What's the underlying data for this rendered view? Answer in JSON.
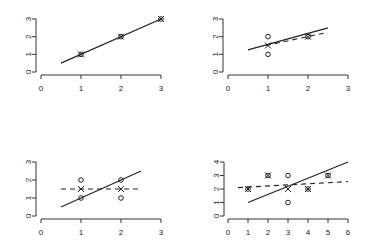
{
  "chart_data": [
    {
      "type": "scatter",
      "panel": "top-left",
      "title": "",
      "xlabel": "",
      "ylabel": "",
      "xlim": [
        0,
        3
      ],
      "ylim": [
        0,
        3
      ],
      "xticks": [
        0,
        1,
        2,
        3
      ],
      "yticks": [
        0,
        1,
        2,
        3
      ],
      "grid": false,
      "points_circle": [
        [
          1,
          1
        ],
        [
          2,
          2
        ],
        [
          3,
          3
        ]
      ],
      "points_cross": [
        [
          1,
          1
        ],
        [
          2,
          2
        ],
        [
          3,
          3
        ]
      ],
      "solid_line": [
        [
          0.5,
          0.5
        ],
        [
          3,
          3
        ]
      ],
      "dashed_line": null
    },
    {
      "type": "scatter",
      "panel": "top-right",
      "title": "",
      "xlabel": "",
      "ylabel": "",
      "xlim": [
        0,
        3
      ],
      "ylim": [
        0,
        3
      ],
      "xticks": [
        0,
        1,
        2,
        3
      ],
      "yticks": [
        0,
        1,
        2,
        3
      ],
      "grid": false,
      "points_circle": [
        [
          1,
          1
        ],
        [
          1,
          2
        ],
        [
          2,
          2
        ]
      ],
      "points_cross": [
        [
          1,
          1.5
        ],
        [
          2,
          2
        ]
      ],
      "solid_line": [
        [
          0.5,
          1.25
        ],
        [
          2.5,
          2.5
        ]
      ],
      "dashed_line": [
        [
          0.95,
          1.5
        ],
        [
          2.4,
          2.2
        ]
      ]
    },
    {
      "type": "scatter",
      "panel": "bottom-left",
      "title": "",
      "xlabel": "",
      "ylabel": "",
      "xlim": [
        0,
        3
      ],
      "ylim": [
        0,
        3
      ],
      "xticks": [
        0,
        1,
        2,
        3
      ],
      "yticks": [
        0,
        1,
        2,
        3
      ],
      "grid": false,
      "points_circle": [
        [
          1,
          1
        ],
        [
          1,
          2
        ],
        [
          2,
          1
        ],
        [
          2,
          2
        ]
      ],
      "points_cross": [
        [
          1,
          1.5
        ],
        [
          2,
          1.5
        ]
      ],
      "solid_line": [
        [
          0.5,
          0.5
        ],
        [
          2.5,
          2.5
        ]
      ],
      "dashed_line": [
        [
          0.5,
          1.5
        ],
        [
          2.5,
          1.5
        ]
      ]
    },
    {
      "type": "scatter",
      "panel": "bottom-right",
      "title": "",
      "xlabel": "",
      "ylabel": "",
      "xlim": [
        0,
        6
      ],
      "ylim": [
        0,
        4
      ],
      "xticks": [
        0,
        1,
        2,
        3,
        4,
        5,
        6
      ],
      "yticks": [
        0,
        1,
        2,
        3,
        4
      ],
      "grid": false,
      "points_circle": [
        [
          1,
          2
        ],
        [
          2,
          3
        ],
        [
          3,
          1
        ],
        [
          3,
          3
        ],
        [
          4,
          2
        ],
        [
          5,
          3
        ]
      ],
      "points_cross": [
        [
          1,
          2
        ],
        [
          2,
          3
        ],
        [
          3,
          2
        ],
        [
          4,
          2
        ],
        [
          5,
          3
        ]
      ],
      "solid_line": [
        [
          1,
          1
        ],
        [
          6,
          4
        ]
      ],
      "dashed_line": [
        [
          0.5,
          2.1
        ],
        [
          6,
          2.55
        ]
      ]
    }
  ],
  "panels": [
    {
      "id": "p1",
      "origin": [
        41,
        72
      ],
      "xscale": 40,
      "yscale": 17.67,
      "yaxis_x": 36,
      "xaxis_y": 75,
      "xticks": [
        "0",
        "1",
        "2",
        "3"
      ],
      "yticks": [
        "0",
        "1",
        "2",
        "3"
      ]
    },
    {
      "id": "p2",
      "origin": [
        228,
        72
      ],
      "xscale": 40,
      "yscale": 17.67,
      "yaxis_x": 223,
      "xaxis_y": 75,
      "xticks": [
        "0",
        "1",
        "2",
        "3"
      ],
      "yticks": [
        "0",
        "1",
        "2",
        "3"
      ]
    },
    {
      "id": "p3",
      "origin": [
        41,
        216
      ],
      "xscale": 40,
      "yscale": 18,
      "yaxis_x": 36,
      "xaxis_y": 219,
      "xticks": [
        "0",
        "1",
        "2",
        "3"
      ],
      "yticks": [
        "0",
        "1",
        "2",
        "3"
      ]
    },
    {
      "id": "p4",
      "origin": [
        228,
        216
      ],
      "xscale": 20,
      "yscale": 13.5,
      "yaxis_x": 224,
      "xaxis_y": 219,
      "xticks": [
        "0",
        "1",
        "2",
        "3",
        "4",
        "5",
        "6"
      ],
      "yticks": [
        "0",
        "1",
        "2",
        "3",
        "4"
      ]
    }
  ],
  "colors": {
    "axis": "#333333",
    "line": "#222222",
    "marker": "#222222",
    "background": "#ffffff"
  }
}
